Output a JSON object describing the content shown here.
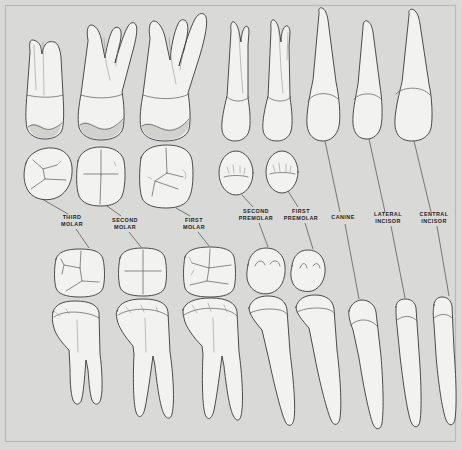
{
  "figure": {
    "name": "permanent-dentition-chart",
    "background_color": "#d9d9d7",
    "frame_color": "#b9b9b6",
    "tooth_fill": "#f2f2f0",
    "tooth_outline": "#3a3a3a",
    "leader_color": "#4a4a4a",
    "label_color": "#1e1e1e",
    "width": 462,
    "height": 450
  },
  "rows": [
    {
      "id": "upper-roots",
      "view": "labial/buccal root view",
      "arch": "upper",
      "y_top": 12,
      "y_bottom": 145
    },
    {
      "id": "upper-occlusal",
      "view": "occlusal view",
      "arch": "upper",
      "y_top": 146,
      "y_bottom": 205
    },
    {
      "id": "lower-occlusal",
      "view": "occlusal view",
      "arch": "lower",
      "y_top": 248,
      "y_bottom": 300
    },
    {
      "id": "lower-roots",
      "view": "labial/buccal root view",
      "arch": "lower",
      "y_top": 300,
      "y_bottom": 432
    }
  ],
  "labels": [
    {
      "id": "third-molar",
      "line1": "THIRD",
      "line2": "MOLAR",
      "x": 72,
      "y": 221
    },
    {
      "id": "second-molar",
      "line1": "SECOND",
      "line2": "MOLAR",
      "x": 125,
      "y": 224
    },
    {
      "id": "first-molar",
      "line1": "FIRST",
      "line2": "MOLAR",
      "x": 194,
      "y": 224
    },
    {
      "id": "second-premolar",
      "line1": "SECOND",
      "line2": "PREMOLAR",
      "x": 256,
      "y": 215
    },
    {
      "id": "first-premolar",
      "line1": "FIRST",
      "line2": "PREMOLAR",
      "x": 301,
      "y": 215
    },
    {
      "id": "canine",
      "line1": "CANINE",
      "line2": "",
      "x": 343,
      "y": 218
    },
    {
      "id": "lateral-incisor",
      "line1": "LATERAL",
      "line2": "INCISOR",
      "x": 388,
      "y": 218
    },
    {
      "id": "central-incisor",
      "line1": "CENTRAL",
      "line2": "INCISOR",
      "x": 434,
      "y": 218
    }
  ],
  "teeth": [
    {
      "id": "third-molar",
      "label": "THIRD MOLAR",
      "upper_root_count": 2,
      "lower_root_count": 2,
      "upper_occlusal_outline": "rounded-rhomboid",
      "lower_occlusal_outline": "rounded-square"
    },
    {
      "id": "second-molar",
      "label": "SECOND MOLAR",
      "upper_root_count": 3,
      "lower_root_count": 2,
      "upper_occlusal_outline": "rounded-rectangle",
      "lower_occlusal_outline": "rounded-square"
    },
    {
      "id": "first-molar",
      "label": "FIRST MOLAR",
      "upper_root_count": 3,
      "lower_root_count": 2,
      "upper_occlusal_outline": "rounded-rectangle",
      "lower_occlusal_outline": "rounded-rectangle"
    },
    {
      "id": "second-premolar",
      "label": "SECOND PREMOLAR",
      "upper_root_count": 1,
      "lower_root_count": 1,
      "upper_occlusal_outline": "oval",
      "lower_occlusal_outline": "oval"
    },
    {
      "id": "first-premolar",
      "label": "FIRST PREMOLAR",
      "upper_root_count": 2,
      "lower_root_count": 1,
      "upper_occlusal_outline": "oval",
      "lower_occlusal_outline": "round"
    },
    {
      "id": "canine",
      "label": "CANINE",
      "upper_root_count": 1,
      "lower_root_count": 1,
      "upper_occlusal_outline": "none",
      "lower_occlusal_outline": "none"
    },
    {
      "id": "lateral-incisor",
      "label": "LATERAL INCISOR",
      "upper_root_count": 1,
      "lower_root_count": 1,
      "upper_occlusal_outline": "none",
      "lower_occlusal_outline": "none"
    },
    {
      "id": "central-incisor",
      "label": "CENTRAL INCISOR",
      "upper_root_count": 1,
      "lower_root_count": 1,
      "upper_occlusal_outline": "none",
      "lower_occlusal_outline": "none"
    }
  ]
}
